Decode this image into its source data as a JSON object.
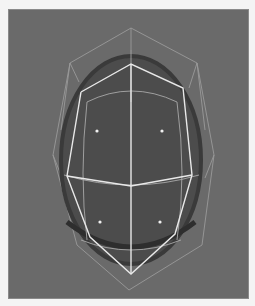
{
  "viewport": {
    "background_color": "#6a6a6a",
    "object": "subdivision sphere with control cage",
    "colors": {
      "surface": "#4a4a4a",
      "surface_shade": "#3a3a3a",
      "cage_outer": "#9a9a9a",
      "cage_selected": "#e8e8e8",
      "isoparm": "#a8a8a8",
      "vertex_point": "#f0f0f0"
    },
    "vertex_points": 4
  }
}
